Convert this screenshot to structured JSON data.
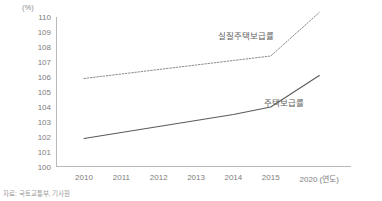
{
  "chart_data": {
    "type": "line",
    "title": "",
    "xlabel": "연도",
    "ylabel": "(%)",
    "ylim": [
      100,
      110
    ],
    "grid": false,
    "legend_position": "inline",
    "unit_label": "(%)",
    "x_axis_suffix": "(연도)",
    "categories": [
      "2010",
      "2011",
      "2012",
      "2013",
      "2014",
      "2015",
      "2020"
    ],
    "y_ticks": [
      "110",
      "109",
      "108",
      "107",
      "106",
      "105",
      "104",
      "103",
      "102",
      "101",
      "100"
    ],
    "series": [
      {
        "name": "실질주택보급률",
        "style": "dotted",
        "color": "#8c8c8c",
        "values": [
          105.9,
          106.2,
          106.5,
          106.8,
          107.1,
          107.4,
          110.3
        ]
      },
      {
        "name": "주택보급률",
        "style": "solid",
        "color": "#5a5a5a",
        "values": [
          101.9,
          102.3,
          102.7,
          103.1,
          103.5,
          104.0,
          106.1
        ]
      }
    ],
    "annotations": [
      {
        "text": "실질주택보급률",
        "series": "실질주택보급률"
      },
      {
        "text": "주택보급률",
        "series": "주택보급률"
      }
    ],
    "source": "자료: 국토교통부, 기사원"
  }
}
